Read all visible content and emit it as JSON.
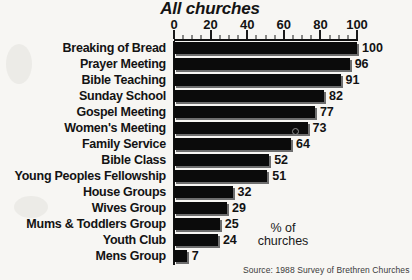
{
  "chart_data": {
    "type": "bar",
    "orientation": "horizontal",
    "title": "All churches",
    "xlabel": "% of churches",
    "ylabel": "",
    "xlim": [
      0,
      100
    ],
    "xticks": [
      0,
      20,
      40,
      60,
      80,
      100
    ],
    "minor_tick_step": 5,
    "grid": false,
    "legend": false,
    "categories": [
      "Breaking of Bread",
      "Prayer Meeting",
      "Bible Teaching",
      "Sunday School",
      "Gospel Meeting",
      "Women's Meeting",
      "Family Service",
      "Bible Class",
      "Young Peoples Fellowship",
      "House Groups",
      "Wives Group",
      "Mums & Toddlers Group",
      "Youth Club",
      "Mens Group"
    ],
    "values": [
      100,
      96,
      91,
      82,
      77,
      73,
      64,
      52,
      51,
      32,
      29,
      25,
      24,
      7
    ],
    "value_labels": [
      "100",
      "96",
      "91",
      "82",
      "77",
      "73",
      "64",
      "52",
      "51",
      "32",
      "29",
      "25",
      "24",
      "7"
    ],
    "annotations": {
      "axis_note_line1": "% of",
      "axis_note_line2": "churches",
      "source": "Source: 1988 Survey of Brethren Churches"
    },
    "colors": {
      "bar": "#0b0b0b",
      "bar_shadow": "#6e6e6e",
      "axis": "#111111",
      "text": "#131313",
      "background": "#f7f6f3"
    }
  }
}
